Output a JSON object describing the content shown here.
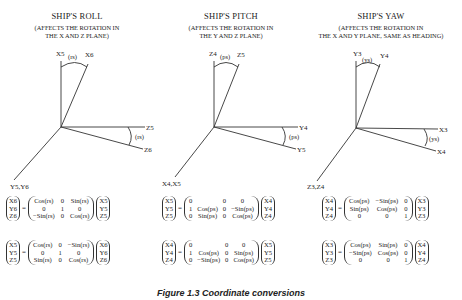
{
  "panels": [
    {
      "title": "SHIP'S ROLL",
      "subtitle_line1": "(AFFECTS THE ROTATION IN",
      "subtitle_line2": "THE X AND Z PLANE)",
      "axes": {
        "up_a": "X5",
        "up_b": "X6",
        "up_angle": "(rs)",
        "right_a": "Z5",
        "right_b": "Z6",
        "right_angle": "(rs)",
        "down": "Y5,Y6"
      },
      "eq1": {
        "lhs": [
          "X6",
          "Y6",
          "Z6"
        ],
        "matrix": [
          [
            "Cos(rs)",
            "0",
            "Sin(rs)"
          ],
          [
            "0",
            "1",
            "0"
          ],
          [
            "−Sin(rs)",
            "0",
            "Cos(rs)"
          ]
        ],
        "rhs": [
          "X5",
          "Y5",
          "Z5"
        ]
      },
      "eq2": {
        "lhs": [
          "X5",
          "Y5",
          "Z5"
        ],
        "matrix": [
          [
            "Cos(rs)",
            "0",
            "−Sin(rs)"
          ],
          [
            "0",
            "1",
            "0"
          ],
          [
            "Sin(rs)",
            "0",
            "Cos(rs)"
          ]
        ],
        "rhs": [
          "X6",
          "Y6",
          "Z6"
        ]
      }
    },
    {
      "title": "SHIP'S PITCH",
      "subtitle_line1": "(AFFECTS THE ROTATION IN",
      "subtitle_line2": "THE Y AND Z PLANE)",
      "axes": {
        "up_a": "Z4",
        "up_b": "Z5",
        "up_angle": "(ps)",
        "right_a": "Y4",
        "right_b": "Y5",
        "right_angle": "(ps)",
        "down": "X4,X5"
      },
      "eq1": {
        "lhs": [
          "X5",
          "Y5",
          "Z5"
        ],
        "matrix": [
          [
            "0",
            "",
            "0",
            "0"
          ],
          [
            "1",
            "Cos(ps)",
            "0",
            "−Sin(ps)"
          ],
          [
            "0",
            "Sin(ps)",
            "0",
            "Cos(ps)"
          ]
        ],
        "rhs": [
          "X4",
          "Y4",
          "Z4"
        ]
      },
      "eq2": {
        "lhs": [
          "X4",
          "Y4",
          "Z4"
        ],
        "matrix": [
          [
            "0",
            "",
            "0",
            "0"
          ],
          [
            "1",
            "Cos(ps)",
            "0",
            "Sin(ps)"
          ],
          [
            "0",
            "−Sin(ps)",
            "0",
            "Cos(ps)"
          ]
        ],
        "rhs": [
          "X5",
          "Y5",
          "Z5"
        ]
      }
    },
    {
      "title": "SHIP'S YAW",
      "subtitle_line1": "(AFFECTS THE ROTATION IN",
      "subtitle_line2": "THE X AND Y PLANE, SAME AS HEADING)",
      "axes": {
        "up_a": "Y3",
        "up_b": "Y4",
        "up_angle": "(ys)",
        "right_a": "X3",
        "right_b": "X4",
        "right_angle": "(ys)",
        "down": "Z3,Z4"
      },
      "eq1": {
        "lhs": [
          "X4",
          "Y4",
          "Z4"
        ],
        "matrix": [
          [
            "Cos(ps)",
            "−Sin(ps)",
            "0"
          ],
          [
            "Sin(ps)",
            "Cos(ps)",
            "0"
          ],
          [
            "0",
            "0",
            "1"
          ]
        ],
        "rhs": [
          "X3",
          "Y3",
          "Z3"
        ]
      },
      "eq2": {
        "lhs": [
          "X3",
          "Y3",
          "Z3"
        ],
        "matrix": [
          [
            "Cos(ps)",
            "Sin(ps)",
            "0"
          ],
          [
            "−Sin(ps)",
            "Cos(ps)",
            "0"
          ],
          [
            "0",
            "0",
            "1"
          ]
        ],
        "rhs": [
          "X4",
          "Y4",
          "Z4"
        ]
      }
    }
  ],
  "equals_sign": "=",
  "caption": "Figure 1.3   Coordinate conversions"
}
